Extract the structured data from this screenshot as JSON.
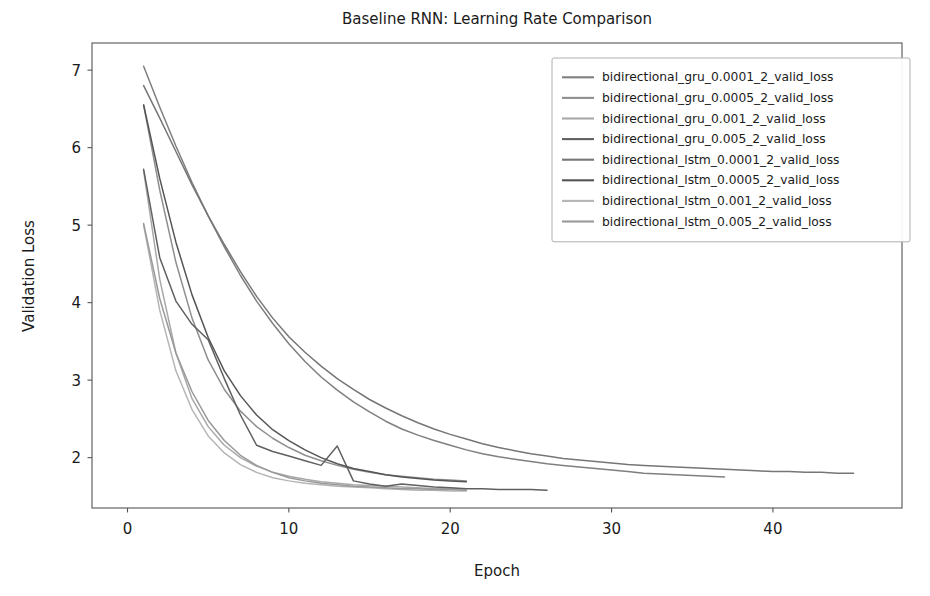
{
  "figure": {
    "width": 930,
    "height": 596,
    "background": "#ffffff"
  },
  "chart_data": {
    "type": "line",
    "title": "Baseline RNN: Learning Rate Comparison",
    "xlabel": "Epoch",
    "ylabel": "Validation Loss",
    "xlim": [
      -2.2,
      48.0
    ],
    "ylim": [
      1.35,
      7.35
    ],
    "xticks": [
      0,
      10,
      20,
      30,
      40
    ],
    "xtick_labels": [
      "0",
      "10",
      "20",
      "30",
      "40"
    ],
    "yticks": [
      2,
      3,
      4,
      5,
      6,
      7
    ],
    "ytick_labels": [
      "2",
      "3",
      "4",
      "5",
      "6",
      "7"
    ],
    "grid": false,
    "legend_position": "upper right",
    "series": [
      {
        "name": "bidirectional_gru_0.0001_2_valid_loss",
        "color": "#7f7f7f",
        "x": [
          1,
          2,
          3,
          4,
          5,
          6,
          7,
          8,
          9,
          10,
          11,
          12,
          13,
          14,
          15,
          16,
          17,
          18,
          19,
          20,
          21,
          22,
          23,
          24,
          25,
          26,
          27,
          28,
          29,
          30,
          31,
          32,
          33,
          34,
          35,
          36,
          37
        ],
        "y": [
          7.05,
          6.52,
          6.02,
          5.55,
          5.12,
          4.72,
          4.35,
          4.02,
          3.73,
          3.47,
          3.24,
          3.04,
          2.87,
          2.72,
          2.59,
          2.47,
          2.37,
          2.29,
          2.22,
          2.16,
          2.1,
          2.05,
          2.01,
          1.98,
          1.95,
          1.92,
          1.9,
          1.88,
          1.86,
          1.84,
          1.82,
          1.8,
          1.79,
          1.78,
          1.77,
          1.76,
          1.75
        ]
      },
      {
        "name": "bidirectional_gru_0.0005_2_valid_loss",
        "color": "#8f8f8f",
        "x": [
          1,
          2,
          3,
          4,
          5,
          6,
          7,
          8,
          9,
          10,
          11,
          12,
          13,
          14,
          15,
          16,
          17,
          18,
          19,
          20,
          21
        ],
        "y": [
          6.55,
          5.45,
          4.52,
          3.8,
          3.26,
          2.88,
          2.6,
          2.4,
          2.25,
          2.13,
          2.03,
          1.96,
          1.9,
          1.85,
          1.81,
          1.78,
          1.76,
          1.74,
          1.72,
          1.71,
          1.7
        ]
      },
      {
        "name": "bidirectional_gru_0.001_2_valid_loss",
        "color": "#a8a8a8",
        "x": [
          1,
          2,
          3,
          4,
          5,
          6,
          7,
          8,
          9,
          10,
          11,
          12,
          13,
          14,
          15,
          16,
          17,
          18,
          19,
          20,
          21
        ],
        "y": [
          5.7,
          4.3,
          3.35,
          2.76,
          2.4,
          2.16,
          2.0,
          1.89,
          1.81,
          1.76,
          1.72,
          1.69,
          1.67,
          1.65,
          1.64,
          1.63,
          1.62,
          1.61,
          1.6,
          1.6,
          1.59
        ]
      },
      {
        "name": "bidirectional_gru_0.005_2_valid_loss",
        "color": "#606060",
        "x": [
          1,
          2,
          3,
          4,
          5,
          6,
          7,
          8,
          9,
          10,
          11,
          12,
          13,
          14,
          15,
          16,
          17,
          18,
          19,
          20,
          21,
          22,
          23,
          24,
          25,
          26
        ],
        "y": [
          5.72,
          4.58,
          4.02,
          3.72,
          3.52,
          3.02,
          2.55,
          2.16,
          2.08,
          2.02,
          1.96,
          1.9,
          2.15,
          1.7,
          1.66,
          1.63,
          1.66,
          1.64,
          1.62,
          1.61,
          1.6,
          1.6,
          1.59,
          1.59,
          1.59,
          1.58
        ]
      },
      {
        "name": "bidirectional_lstm_0.0001_2_valid_loss",
        "color": "#767676",
        "x": [
          1,
          2,
          3,
          4,
          5,
          6,
          7,
          8,
          9,
          10,
          11,
          12,
          13,
          14,
          15,
          16,
          17,
          18,
          19,
          20,
          21,
          22,
          23,
          24,
          25,
          26,
          27,
          28,
          29,
          30,
          31,
          32,
          33,
          34,
          35,
          36,
          37,
          38,
          39,
          40,
          41,
          42,
          43,
          44,
          45
        ],
        "y": [
          6.8,
          6.38,
          5.95,
          5.52,
          5.12,
          4.75,
          4.4,
          4.08,
          3.8,
          3.56,
          3.36,
          3.18,
          3.02,
          2.88,
          2.75,
          2.64,
          2.54,
          2.45,
          2.37,
          2.3,
          2.24,
          2.18,
          2.13,
          2.09,
          2.05,
          2.02,
          1.99,
          1.97,
          1.95,
          1.93,
          1.91,
          1.9,
          1.89,
          1.88,
          1.87,
          1.86,
          1.85,
          1.84,
          1.83,
          1.82,
          1.82,
          1.81,
          1.81,
          1.8,
          1.8
        ]
      },
      {
        "name": "bidirectional_lstm_0.0005_2_valid_loss",
        "color": "#555555",
        "x": [
          1,
          2,
          3,
          4,
          5,
          6,
          7,
          8,
          9,
          10,
          11,
          12,
          13,
          14,
          15,
          16,
          17,
          18,
          19,
          20,
          21
        ],
        "y": [
          6.55,
          5.6,
          4.78,
          4.1,
          3.55,
          3.12,
          2.8,
          2.55,
          2.36,
          2.22,
          2.1,
          2.0,
          1.92,
          1.86,
          1.82,
          1.78,
          1.75,
          1.73,
          1.71,
          1.7,
          1.69
        ]
      },
      {
        "name": "bidirectional_lstm_0.001_2_valid_loss",
        "color": "#b5b5b5",
        "x": [
          1,
          2,
          3,
          4,
          5,
          6,
          7,
          8,
          9,
          10,
          11,
          12,
          13,
          14,
          15,
          16,
          17,
          18,
          19,
          20,
          21
        ],
        "y": [
          5.0,
          3.9,
          3.12,
          2.62,
          2.28,
          2.06,
          1.91,
          1.81,
          1.74,
          1.7,
          1.67,
          1.65,
          1.63,
          1.62,
          1.61,
          1.6,
          1.59,
          1.58,
          1.58,
          1.57,
          1.57
        ]
      },
      {
        "name": "bidirectional_lstm_0.005_2_valid_loss",
        "color": "#999999",
        "x": [
          1,
          2,
          3,
          4,
          5,
          6,
          7,
          8,
          9,
          10,
          11,
          12,
          13,
          14,
          15,
          16,
          17,
          18,
          19,
          20,
          21
        ],
        "y": [
          5.02,
          4.05,
          3.35,
          2.85,
          2.48,
          2.22,
          2.03,
          1.9,
          1.81,
          1.74,
          1.7,
          1.67,
          1.65,
          1.63,
          1.62,
          1.61,
          1.6,
          1.6,
          1.59,
          1.59,
          1.58
        ]
      }
    ]
  },
  "legend": {
    "entries": [
      "bidirectional_gru_0.0001_2_valid_loss",
      "bidirectional_gru_0.0005_2_valid_loss",
      "bidirectional_gru_0.001_2_valid_loss",
      "bidirectional_gru_0.005_2_valid_loss",
      "bidirectional_lstm_0.0001_2_valid_loss",
      "bidirectional_lstm_0.0005_2_valid_loss",
      "bidirectional_lstm_0.001_2_valid_loss",
      "bidirectional_lstm_0.005_2_valid_loss"
    ]
  }
}
